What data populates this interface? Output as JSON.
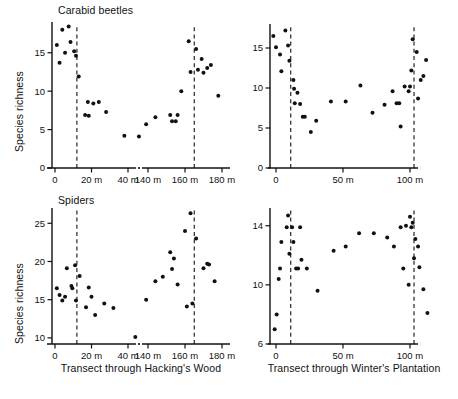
{
  "figure": {
    "width": 458,
    "height": 399,
    "background": "#ffffff",
    "ink": "#111111"
  },
  "panels": {
    "top_left": {
      "title": "Carabid beetles",
      "ylabel": "Species richness",
      "xcaption": "Transect through Hacking's Wood"
    },
    "top_right": {
      "title": "",
      "ylabel": "",
      "xcaption": "Transect through Winter's Plantation"
    },
    "bottom_left": {
      "title": "Spiders",
      "ylabel": "Species richness",
      "xcaption": "Transect through Hacking's Wood"
    },
    "bottom_right": {
      "title": "",
      "ylabel": "",
      "xcaption": "Transect through Winter's Plantation"
    }
  },
  "chart_data": [
    {
      "id": "carabid-hackings-wood",
      "type": "scatter",
      "title": "Carabid beetles",
      "xlabel": "Transect through Hacking's Wood",
      "ylabel": "Species richness",
      "ylim": [
        0,
        19
      ],
      "yticks": [
        0,
        5,
        10,
        15
      ],
      "ytick_labels": [
        "0",
        "5",
        "10",
        "15"
      ],
      "xticks": [
        0,
        20,
        40,
        140,
        160,
        180
      ],
      "xtick_labels": [
        "0",
        "20 m",
        "40 m",
        "140 m",
        "160 m",
        "180 m"
      ],
      "axis_break": true,
      "axis_break_between": [
        50,
        130
      ],
      "grid": false,
      "legend": "none",
      "edge_markers": [
        12,
        165
      ],
      "edge_marker_style": "dashed vertical line",
      "points": [
        {
          "x": 1,
          "y": 16.0
        },
        {
          "x": 2.5,
          "y": 13.7
        },
        {
          "x": 4,
          "y": 18.0
        },
        {
          "x": 5.5,
          "y": 15.0
        },
        {
          "x": 7.5,
          "y": 18.4
        },
        {
          "x": 8.5,
          "y": 16.4
        },
        {
          "x": 10.5,
          "y": 15.2
        },
        {
          "x": 11.5,
          "y": 14.6
        },
        {
          "x": 13,
          "y": 11.9
        },
        {
          "x": 16.5,
          "y": 6.9
        },
        {
          "x": 18,
          "y": 8.6
        },
        {
          "x": 18.5,
          "y": 6.8
        },
        {
          "x": 21,
          "y": 8.4
        },
        {
          "x": 24,
          "y": 8.6
        },
        {
          "x": 28,
          "y": 7.3
        },
        {
          "x": 38,
          "y": 4.2
        },
        {
          "x": 46,
          "y": 4.1
        },
        {
          "x": 139,
          "y": 5.7
        },
        {
          "x": 144,
          "y": 6.6
        },
        {
          "x": 152,
          "y": 6.9
        },
        {
          "x": 153,
          "y": 6.1
        },
        {
          "x": 155,
          "y": 6.1
        },
        {
          "x": 156,
          "y": 6.9
        },
        {
          "x": 158,
          "y": 10.0
        },
        {
          "x": 162,
          "y": 16.5
        },
        {
          "x": 163,
          "y": 12.5
        },
        {
          "x": 166,
          "y": 15.5
        },
        {
          "x": 167,
          "y": 12.8
        },
        {
          "x": 169,
          "y": 14.2
        },
        {
          "x": 170,
          "y": 12.4
        },
        {
          "x": 172,
          "y": 13.0
        },
        {
          "x": 174,
          "y": 13.4
        },
        {
          "x": 178,
          "y": 9.4
        }
      ]
    },
    {
      "id": "carabid-winters-plantation",
      "type": "scatter",
      "title": "Carabid beetles",
      "xlabel": "Transect through Winter's Plantation",
      "ylabel": "Species richness",
      "ylim": [
        0,
        18
      ],
      "yticks": [
        0,
        5,
        10,
        15
      ],
      "ytick_labels": [
        "0",
        "5",
        "10",
        "15"
      ],
      "xticks": [
        0,
        50,
        100
      ],
      "xtick_labels": [
        "0",
        "50 m",
        "100 m"
      ],
      "axis_break": false,
      "grid": false,
      "legend": "none",
      "edge_markers": [
        11,
        103
      ],
      "edge_marker_style": "dashed vertical line",
      "points": [
        {
          "x": -2,
          "y": 16.5
        },
        {
          "x": 0,
          "y": 15.1
        },
        {
          "x": 3,
          "y": 14.2
        },
        {
          "x": 4,
          "y": 12.1
        },
        {
          "x": 7,
          "y": 17.2
        },
        {
          "x": 9,
          "y": 15.3
        },
        {
          "x": 10,
          "y": 13.4
        },
        {
          "x": 13,
          "y": 11.0
        },
        {
          "x": 13.5,
          "y": 9.9
        },
        {
          "x": 14,
          "y": 8.1
        },
        {
          "x": 16,
          "y": 9.4
        },
        {
          "x": 18,
          "y": 8.0
        },
        {
          "x": 20,
          "y": 6.4
        },
        {
          "x": 21.5,
          "y": 6.4
        },
        {
          "x": 26,
          "y": 4.5
        },
        {
          "x": 30,
          "y": 5.9
        },
        {
          "x": 41,
          "y": 8.3
        },
        {
          "x": 52,
          "y": 8.3
        },
        {
          "x": 63,
          "y": 10.3
        },
        {
          "x": 72,
          "y": 6.9
        },
        {
          "x": 81,
          "y": 7.9
        },
        {
          "x": 87,
          "y": 9.6
        },
        {
          "x": 90,
          "y": 8.1
        },
        {
          "x": 92,
          "y": 8.1
        },
        {
          "x": 93,
          "y": 5.2
        },
        {
          "x": 96,
          "y": 10.2
        },
        {
          "x": 99,
          "y": 9.6
        },
        {
          "x": 100,
          "y": 10.2
        },
        {
          "x": 101,
          "y": 12.2
        },
        {
          "x": 102,
          "y": 16.1
        },
        {
          "x": 105,
          "y": 14.5
        },
        {
          "x": 106,
          "y": 8.7
        },
        {
          "x": 108,
          "y": 11.0
        },
        {
          "x": 110,
          "y": 11.5
        },
        {
          "x": 112,
          "y": 13.5
        }
      ]
    },
    {
      "id": "spiders-hackings-wood",
      "type": "scatter",
      "title": "Spiders",
      "xlabel": "Transect through Hacking's Wood",
      "ylabel": "Species richness",
      "ylim": [
        9.2,
        27
      ],
      "yticks": [
        10,
        15,
        20,
        25
      ],
      "ytick_labels": [
        "10",
        "15",
        "20",
        "25"
      ],
      "xticks": [
        0,
        20,
        40,
        140,
        160,
        180
      ],
      "xtick_labels": [
        "0",
        "20 m",
        "40 m",
        "140 m",
        "160 m",
        "180 m"
      ],
      "axis_break": true,
      "axis_break_between": [
        50,
        130
      ],
      "grid": false,
      "legend": "none",
      "edge_markers": [
        12,
        165
      ],
      "edge_marker_style": "dashed vertical line",
      "points": [
        {
          "x": 1,
          "y": 16.5
        },
        {
          "x": 2.5,
          "y": 15.6
        },
        {
          "x": 4,
          "y": 14.9
        },
        {
          "x": 5.5,
          "y": 15.4
        },
        {
          "x": 6.5,
          "y": 19.1
        },
        {
          "x": 9,
          "y": 16.8
        },
        {
          "x": 9.5,
          "y": 16.5
        },
        {
          "x": 11,
          "y": 19.5
        },
        {
          "x": 11.5,
          "y": 14.9
        },
        {
          "x": 13.5,
          "y": 18.1
        },
        {
          "x": 17,
          "y": 14.0
        },
        {
          "x": 18.5,
          "y": 16.6
        },
        {
          "x": 20,
          "y": 15.4
        },
        {
          "x": 22,
          "y": 13.0
        },
        {
          "x": 27,
          "y": 14.5
        },
        {
          "x": 32,
          "y": 13.9
        },
        {
          "x": 44,
          "y": 10.1
        },
        {
          "x": 139,
          "y": 15.0
        },
        {
          "x": 144,
          "y": 17.4
        },
        {
          "x": 148,
          "y": 18.0
        },
        {
          "x": 152,
          "y": 21.2
        },
        {
          "x": 153,
          "y": 19.0
        },
        {
          "x": 154,
          "y": 20.4
        },
        {
          "x": 156,
          "y": 17.0
        },
        {
          "x": 160,
          "y": 24.0
        },
        {
          "x": 161,
          "y": 14.1
        },
        {
          "x": 163,
          "y": 26.3
        },
        {
          "x": 164,
          "y": 14.5
        },
        {
          "x": 166,
          "y": 23.0
        },
        {
          "x": 170,
          "y": 19.1
        },
        {
          "x": 172,
          "y": 19.7
        },
        {
          "x": 173,
          "y": 19.6
        },
        {
          "x": 176,
          "y": 17.4
        }
      ]
    },
    {
      "id": "spiders-winters-plantation",
      "type": "scatter",
      "title": "Spiders",
      "xlabel": "Transect through Winter's Plantation",
      "ylabel": "Species richness",
      "ylim": [
        6,
        15.2
      ],
      "yticks": [
        6,
        10,
        14
      ],
      "ytick_labels": [
        "6",
        "10",
        "14"
      ],
      "xticks": [
        0,
        50,
        100
      ],
      "xtick_labels": [
        "0",
        "50 m",
        "100 m"
      ],
      "axis_break": false,
      "grid": false,
      "legend": "none",
      "edge_markers": [
        11,
        103
      ],
      "edge_marker_style": "dashed vertical line",
      "points": [
        {
          "x": -1,
          "y": 7.0
        },
        {
          "x": 0.5,
          "y": 8.0
        },
        {
          "x": 2,
          "y": 10.4
        },
        {
          "x": 3,
          "y": 11.1
        },
        {
          "x": 4,
          "y": 12.9
        },
        {
          "x": 8,
          "y": 13.9
        },
        {
          "x": 9,
          "y": 14.7
        },
        {
          "x": 10,
          "y": 12.1
        },
        {
          "x": 12,
          "y": 13.9
        },
        {
          "x": 13,
          "y": 12.9
        },
        {
          "x": 15,
          "y": 11.1
        },
        {
          "x": 16.5,
          "y": 11.1
        },
        {
          "x": 18,
          "y": 13.9
        },
        {
          "x": 19,
          "y": 11.7
        },
        {
          "x": 23,
          "y": 11.1
        },
        {
          "x": 31,
          "y": 9.6
        },
        {
          "x": 43,
          "y": 12.3
        },
        {
          "x": 52,
          "y": 12.6
        },
        {
          "x": 62,
          "y": 13.5
        },
        {
          "x": 73,
          "y": 13.5
        },
        {
          "x": 83,
          "y": 13.2
        },
        {
          "x": 88,
          "y": 12.6
        },
        {
          "x": 93,
          "y": 13.9
        },
        {
          "x": 95,
          "y": 11.1
        },
        {
          "x": 97,
          "y": 14.0
        },
        {
          "x": 99,
          "y": 10.0
        },
        {
          "x": 100,
          "y": 14.6
        },
        {
          "x": 101,
          "y": 13.9
        },
        {
          "x": 102,
          "y": 14.2
        },
        {
          "x": 103,
          "y": 11.8
        },
        {
          "x": 104,
          "y": 13.1
        },
        {
          "x": 106,
          "y": 12.6
        },
        {
          "x": 107,
          "y": 11.2
        },
        {
          "x": 110,
          "y": 9.7
        },
        {
          "x": 113,
          "y": 8.1
        }
      ]
    }
  ]
}
